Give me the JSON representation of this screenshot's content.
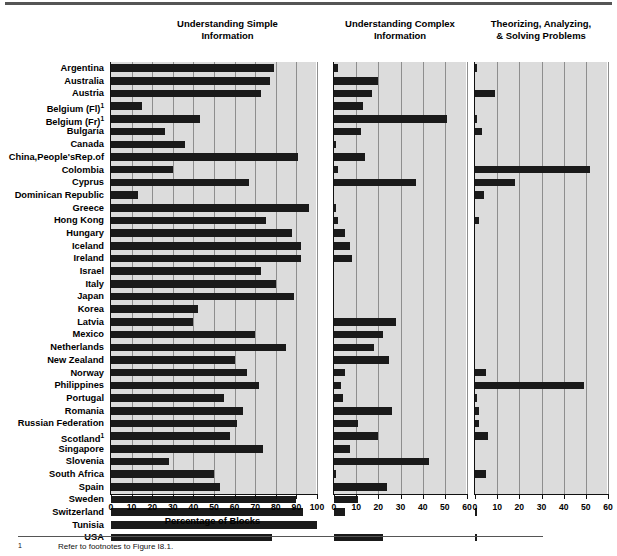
{
  "figure": {
    "axis_caption": "Percentage of Blocks",
    "footnote_marker": "1",
    "footnote_text": "Refer to footnotes to Figure I8.1."
  },
  "panels": [
    {
      "title_line1": "Understanding Simple",
      "title_line2": "Information",
      "xmax": 100,
      "ticks": [
        0,
        10,
        20,
        30,
        40,
        50,
        60,
        70,
        80,
        90,
        100
      ]
    },
    {
      "title_line1": "Understanding Complex",
      "title_line2": "Information",
      "xmax": 60,
      "ticks": [
        0,
        10,
        20,
        30,
        40,
        50,
        60
      ]
    },
    {
      "title_line1": "Theorizing, Analyzing,",
      "title_line2": "& Solving Problems",
      "xmax": 60,
      "ticks": [
        0,
        10,
        20,
        30,
        40,
        50,
        60
      ]
    }
  ],
  "chart_data": {
    "type": "bar",
    "orientation": "horizontal",
    "xlabel": "Percentage of Blocks",
    "ylabel": "",
    "grid": true,
    "legend": "none",
    "categories": [
      "Argentina",
      "Australia",
      "Austria",
      "Belgium (Fl)",
      "Belgium (Fr)",
      "Bulgaria",
      "Canada",
      "China,People'sRep.of",
      "Colombia",
      "Cyprus",
      "Dominican Republic",
      "Greece",
      "Hong Kong",
      "Hungary",
      "Iceland",
      "Ireland",
      "Israel",
      "Italy",
      "Japan",
      "Korea",
      "Latvia",
      "Mexico",
      "Netherlands",
      "New Zealand",
      "Norway",
      "Philippines",
      "Portugal",
      "Romania",
      "Russian Federation",
      "Scotland",
      "Singapore",
      "Slovenia",
      "South Africa",
      "Spain",
      "Sweden",
      "Switzerland",
      "Tunisia",
      "USA"
    ],
    "category_footnote_marks": {
      "Belgium (Fl)": "1",
      "Belgium (Fr)": "1",
      "Scotland": "1"
    },
    "series": [
      {
        "name": "Understanding Simple Information",
        "xlim": [
          0,
          100
        ],
        "values": [
          79,
          77,
          73,
          15,
          43,
          26,
          36,
          91,
          30,
          67,
          13,
          96,
          75,
          88,
          92,
          92,
          73,
          80,
          89,
          42,
          40,
          70,
          85,
          60,
          66,
          72,
          55,
          64,
          61,
          58,
          74,
          28,
          50,
          53,
          90,
          93,
          100,
          78
        ]
      },
      {
        "name": "Understanding Complex Information",
        "xlim": [
          0,
          60
        ],
        "values": [
          2,
          20,
          17,
          13,
          51,
          12,
          1,
          14,
          2,
          37,
          0,
          1,
          2,
          5,
          7,
          8,
          0,
          0,
          0,
          0,
          28,
          22,
          18,
          25,
          5,
          3,
          4,
          26,
          11,
          20,
          7,
          43,
          1,
          24,
          11,
          5,
          0,
          22
        ]
      },
      {
        "name": "Theorizing, Analyzing, & Solving Problems",
        "xlim": [
          0,
          60
        ],
        "values": [
          1,
          0,
          9,
          0,
          1,
          3,
          0,
          0,
          52,
          18,
          4,
          0,
          2,
          0,
          0,
          0,
          0,
          0,
          0,
          0,
          0,
          0,
          0,
          0,
          5,
          49,
          1,
          2,
          2,
          6,
          0,
          0,
          5,
          0,
          0,
          1,
          0,
          1
        ]
      }
    ]
  }
}
